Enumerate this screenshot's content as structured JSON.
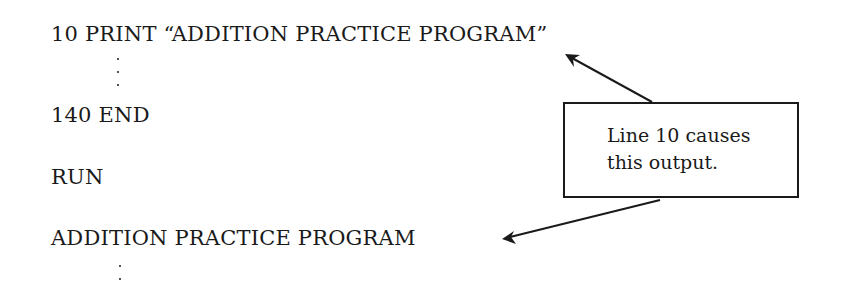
{
  "listing": {
    "line_10": "10 PRINT “ADDITION PRACTICE PROGRAM”",
    "line_140": "140 END",
    "command": "RUN",
    "output": "ADDITION PRACTICE PROGRAM"
  },
  "callout": {
    "line1": "Line 10 causes",
    "line2": "this output."
  },
  "colors": {
    "ink": "#1a1a1a",
    "background": "#ffffff"
  }
}
